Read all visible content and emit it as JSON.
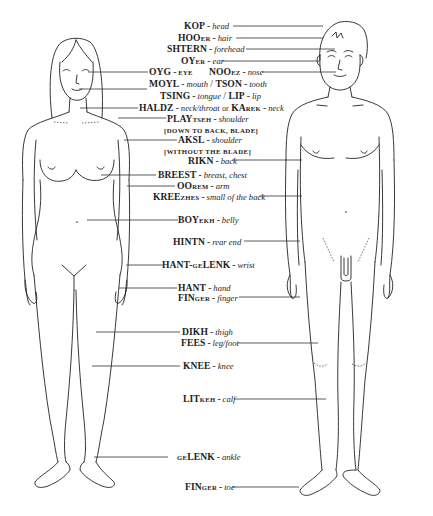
{
  "diagram": {
    "figures": [
      "female-figure",
      "male-figure"
    ],
    "labels": [
      {
        "id": "kop",
        "word": "KOP",
        "suffix": "",
        "translation": "head"
      },
      {
        "id": "hooer",
        "word": "HOO",
        "suffix": "ER",
        "translation": "hair"
      },
      {
        "id": "shtern",
        "word": "SHTERN",
        "suffix": "",
        "translation": "forehead"
      },
      {
        "id": "oyer",
        "word": "OY",
        "suffix": "ER",
        "translation": "ear"
      },
      {
        "id": "oyg",
        "word": "OYG",
        "suffix": "",
        "translation": "EYE"
      },
      {
        "id": "nooez",
        "word": "NOO",
        "suffix": "EZ",
        "translation": "nose"
      },
      {
        "id": "moyl",
        "word": "MOYL",
        "suffix": "",
        "translation": "mouth"
      },
      {
        "id": "tson",
        "word": "TSON",
        "suffix": "",
        "translation": "tooth"
      },
      {
        "id": "tsing",
        "word": "TSING",
        "suffix": "",
        "translation": "tongue"
      },
      {
        "id": "lip",
        "word": "LIP",
        "suffix": "",
        "translation": "lip"
      },
      {
        "id": "haldz",
        "word": "HALDZ",
        "suffix": "",
        "translation": "neck/throat"
      },
      {
        "id": "karek",
        "word": "KA",
        "suffix": "REK",
        "translation": "neck"
      },
      {
        "id": "playtseh",
        "word": "PLAY",
        "suffix": "TSEH",
        "translation": "shoulder"
      },
      {
        "id": "aksl",
        "word": "AKSL",
        "suffix": "",
        "translation": "shoulder"
      },
      {
        "id": "rikn",
        "word": "RIKN",
        "suffix": "",
        "translation": "back"
      },
      {
        "id": "breest",
        "word": "BREEST",
        "suffix": "",
        "translation": "breast, chest"
      },
      {
        "id": "oorem",
        "word": "OO",
        "suffix": "REM",
        "translation": "arm"
      },
      {
        "id": "kreezhes",
        "word": "KREE",
        "suffix": "ZHES",
        "translation": "small of the back"
      },
      {
        "id": "boyekh",
        "word": "BOY",
        "suffix": "EKH",
        "translation": "belly"
      },
      {
        "id": "hintn",
        "word": "HINTN",
        "suffix": "",
        "translation": "rear end"
      },
      {
        "id": "hant-gelenk",
        "word": "HANT-",
        "suffix": "GE",
        "word2": "LENK",
        "translation": "wrist"
      },
      {
        "id": "hant",
        "word": "HANT",
        "suffix": "",
        "translation": "hand"
      },
      {
        "id": "finger",
        "word": "FIN",
        "suffix": "GER",
        "translation": "finger"
      },
      {
        "id": "dikh",
        "word": "DIKH",
        "suffix": "",
        "translation": "thigh"
      },
      {
        "id": "fees",
        "word": "FEES",
        "suffix": "",
        "translation": "leg/foot"
      },
      {
        "id": "knee",
        "word": "KNEE",
        "suffix": "",
        "translation": "knee"
      },
      {
        "id": "litkeh",
        "word": "LIT",
        "suffix": "KEH",
        "translation": "calf"
      },
      {
        "id": "gelenk",
        "prefix": "GE",
        "word": "LENK",
        "suffix": "",
        "translation": "ankle"
      },
      {
        "id": "finger-toe",
        "word": "FIN",
        "suffix": "GER",
        "translation": "toe"
      }
    ],
    "connectors": {
      "or": "or",
      "slash": "/",
      "dash": "-"
    },
    "notes": {
      "playtseh": "[DOWN TO BACK, BLADE]",
      "aksl": "[WITHOUT THE BLADE]"
    }
  }
}
